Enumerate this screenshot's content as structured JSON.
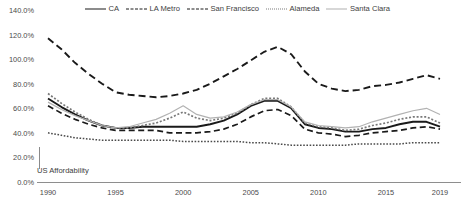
{
  "chart_data": {
    "type": "line",
    "title": "",
    "xlabel": "",
    "ylabel": "",
    "xlim": [
      1990,
      2019
    ],
    "ylim": [
      0,
      140
    ],
    "y_ticks": [
      "0.0%",
      "20.0%",
      "40.0%",
      "60.0%",
      "80.0%",
      "100.0%",
      "120.0%",
      "140.0%"
    ],
    "y_tick_values": [
      0,
      20,
      40,
      60,
      80,
      100,
      120,
      140
    ],
    "x_ticks": [
      "1990",
      "1995",
      "2000",
      "2005",
      "2010",
      "2015",
      "2019"
    ],
    "x_tick_values": [
      1990,
      1995,
      2000,
      2005,
      2010,
      2015,
      2019
    ],
    "grid": false,
    "legend_position": "top",
    "annotations": [
      {
        "text": "US Affordability",
        "x": 1990,
        "y": 33
      }
    ],
    "x": [
      1990,
      1991,
      1992,
      1993,
      1994,
      1995,
      1996,
      1997,
      1998,
      1999,
      2000,
      2001,
      2002,
      2003,
      2004,
      2005,
      2006,
      2007,
      2008,
      2009,
      2010,
      2011,
      2012,
      2013,
      2014,
      2015,
      2016,
      2017,
      2018,
      2019
    ],
    "series": [
      {
        "name": "CA",
        "style": "solid",
        "color": "#1a1a1a",
        "width": 1.9,
        "values": [
          68,
          61,
          55,
          50,
          46,
          44,
          44,
          45,
          45,
          45,
          45,
          45,
          47,
          50,
          55,
          62,
          66,
          66,
          60,
          47,
          44,
          43,
          41,
          41,
          43,
          44,
          47,
          49,
          49,
          45
        ]
      },
      {
        "name": "LA Metro",
        "style": "dashed",
        "color": "#1a1a1a",
        "width": 1.9,
        "values": [
          117,
          108,
          97,
          88,
          80,
          73,
          71,
          70,
          69,
          70,
          72,
          75,
          80,
          86,
          92,
          99,
          106,
          110,
          104,
          90,
          80,
          76,
          74,
          75,
          78,
          79,
          81,
          84,
          87,
          84
        ]
      },
      {
        "name": "San Francisco",
        "style": "dashed-long",
        "color": "#1a1a1a",
        "width": 1.7,
        "values": [
          62,
          56,
          51,
          47,
          44,
          42,
          42,
          42,
          42,
          40,
          40,
          40,
          41,
          43,
          47,
          53,
          58,
          59,
          54,
          43,
          40,
          39,
          37,
          38,
          40,
          41,
          42,
          44,
          45,
          43
        ]
      },
      {
        "name": "Alameda",
        "style": "dotted",
        "color": "#787878",
        "width": 1.7,
        "values": [
          72,
          64,
          57,
          51,
          46,
          44,
          44,
          46,
          48,
          52,
          57,
          52,
          50,
          52,
          56,
          63,
          68,
          68,
          61,
          48,
          45,
          44,
          42,
          43,
          46,
          48,
          51,
          53,
          53,
          48
        ]
      },
      {
        "name": "Santa Clara",
        "style": "solid-thin",
        "color": "#b2b2b2",
        "width": 1.2,
        "values": [
          65,
          59,
          54,
          50,
          46,
          44,
          45,
          48,
          51,
          56,
          62,
          55,
          52,
          53,
          57,
          63,
          67,
          67,
          61,
          49,
          46,
          45,
          44,
          45,
          49,
          52,
          55,
          58,
          60,
          55
        ]
      },
      {
        "name": "US Affordability",
        "style": "dotted-dense",
        "color": "#4a4a4a",
        "width": 1.5,
        "show_in_legend": false,
        "values": [
          40,
          38,
          36,
          35,
          34,
          34,
          34,
          34,
          34,
          34,
          33,
          33,
          33,
          33,
          33,
          32,
          32,
          31,
          30,
          30,
          30,
          30,
          30,
          31,
          31,
          31,
          31,
          32,
          32,
          32
        ]
      }
    ]
  },
  "legend": {
    "items": [
      {
        "label": "CA"
      },
      {
        "label": "LA Metro"
      },
      {
        "label": "San Francisco"
      },
      {
        "label": "Alameda"
      },
      {
        "label": "Santa Clara"
      }
    ]
  },
  "annotation": {
    "us_affordability": "US Affordability"
  }
}
